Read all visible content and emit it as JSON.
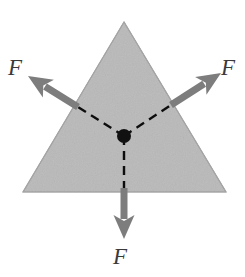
{
  "figure": {
    "background_color": "#ffffff",
    "width": 245,
    "height": 277
  },
  "shape": {
    "name": "triangle",
    "kind": "equilateral-triangle",
    "fill_color": "#b9b9b9",
    "edge_color": "#9a9a9a",
    "vertices": [
      {
        "x": 124,
        "y": 22
      },
      {
        "x": 23,
        "y": 192
      },
      {
        "x": 226,
        "y": 192
      }
    ]
  },
  "center_point": {
    "name": "centroid",
    "x": 124,
    "y": 136,
    "radius": 7,
    "color": "#111111"
  },
  "arrows": [
    {
      "id": "force-left",
      "label": "F",
      "color": "#7d7d7d",
      "direction_deg": 150,
      "tail": {
        "x": 124,
        "y": 136
      },
      "tip": {
        "x": 28,
        "y": 76
      },
      "solid_from": {
        "x": 78,
        "y": 107
      },
      "shaft_width": 7,
      "head_length": 24,
      "head_width": 21
    },
    {
      "id": "force-right",
      "label": "F",
      "color": "#7d7d7d",
      "direction_deg": 30,
      "tail": {
        "x": 124,
        "y": 136
      },
      "tip": {
        "x": 221,
        "y": 73
      },
      "solid_from": {
        "x": 171,
        "y": 105
      },
      "shaft_width": 7,
      "head_length": 24,
      "head_width": 21
    },
    {
      "id": "force-bottom",
      "label": "F",
      "color": "#7d7d7d",
      "direction_deg": 270,
      "tail": {
        "x": 124,
        "y": 136
      },
      "tip": {
        "x": 124,
        "y": 239
      },
      "solid_from": {
        "x": 124,
        "y": 188
      },
      "shaft_width": 7,
      "head_length": 24,
      "head_width": 21
    }
  ],
  "dashed_lines": [
    {
      "id": "dash-left",
      "from": {
        "x": 124,
        "y": 136
      },
      "to": {
        "x": 78,
        "y": 107
      },
      "color": "#111111",
      "width": 2.4,
      "dash": "9 6"
    },
    {
      "id": "dash-right",
      "from": {
        "x": 124,
        "y": 136
      },
      "to": {
        "x": 171,
        "y": 105
      },
      "color": "#111111",
      "width": 2.4,
      "dash": "9 6"
    },
    {
      "id": "dash-bottom",
      "from": {
        "x": 124,
        "y": 136
      },
      "to": {
        "x": 124,
        "y": 190
      },
      "color": "#111111",
      "width": 2.4,
      "dash": "9 6"
    }
  ],
  "labels": {
    "left": {
      "text": "F"
    },
    "right": {
      "text": "F"
    },
    "bottom": {
      "text": "F"
    }
  }
}
